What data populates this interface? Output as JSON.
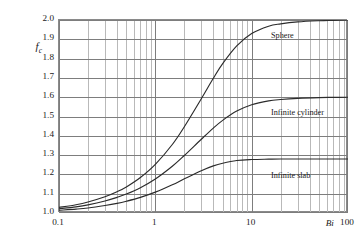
{
  "chart_data": {
    "type": "line",
    "title": "",
    "xlabel": "Bi",
    "ylabel": "f_c",
    "ylabel_base": "f",
    "ylabel_sub": "c",
    "xscale": "log",
    "yscale": "linear",
    "xlim": [
      0.1,
      100
    ],
    "ylim": [
      1.0,
      2.0
    ],
    "grid": true,
    "grid_style": "log-minor-vertical-and-major-horizontal",
    "legend_position": "inline-right",
    "xticks": [
      "0.1",
      "1",
      "10",
      "100"
    ],
    "xtick_values": [
      0.1,
      1,
      10,
      100
    ],
    "yticks": [
      "1.0",
      "1.1",
      "1.2",
      "1.3",
      "1.4",
      "1.5",
      "1.6",
      "1.7",
      "1.8",
      "1.9",
      "2.0"
    ],
    "ytick_values": [
      1.0,
      1.1,
      1.2,
      1.3,
      1.4,
      1.5,
      1.6,
      1.7,
      1.8,
      1.9,
      2.0
    ],
    "x": [
      0.1,
      0.15,
      0.2,
      0.3,
      0.4,
      0.5,
      0.7,
      1.0,
      1.5,
      2.0,
      3.0,
      4.0,
      5.0,
      7.0,
      10.0,
      15.0,
      20.0,
      30.0,
      50.0,
      70.0,
      100.0
    ],
    "series": [
      {
        "name": "Sphere",
        "label": "Sphere",
        "color": "#2b2b2b",
        "plateau": 2.0,
        "values": [
          1.029,
          1.043,
          1.057,
          1.084,
          1.11,
          1.135,
          1.184,
          1.252,
          1.355,
          1.447,
          1.592,
          1.698,
          1.774,
          1.866,
          1.93,
          1.968,
          1.98,
          1.99,
          1.996,
          1.998,
          2.0
        ]
      },
      {
        "name": "Infinite cylinder",
        "label": "Infinite cylinder",
        "color": "#2b2b2b",
        "plateau": 1.6,
        "values": [
          1.022,
          1.032,
          1.042,
          1.062,
          1.081,
          1.098,
          1.131,
          1.176,
          1.242,
          1.298,
          1.382,
          1.44,
          1.48,
          1.528,
          1.561,
          1.581,
          1.588,
          1.594,
          1.598,
          1.599,
          1.6
        ]
      },
      {
        "name": "Infinite slab",
        "label": "Infinite slab",
        "color": "#2b2b2b",
        "plateau": 1.28,
        "values": [
          1.014,
          1.02,
          1.026,
          1.039,
          1.05,
          1.061,
          1.081,
          1.108,
          1.146,
          1.177,
          1.219,
          1.244,
          1.258,
          1.272,
          1.277,
          1.279,
          1.28,
          1.28,
          1.28,
          1.28,
          1.28
        ]
      }
    ],
    "annotations": [
      {
        "text": "Sphere",
        "x_px": 271,
        "y_px": 31
      },
      {
        "text": "Infinite cylinder",
        "x_px": 271,
        "y_px": 108
      },
      {
        "text": "Infinite slab",
        "x_px": 271,
        "y_px": 171
      }
    ],
    "colors": {
      "curve": "#2b2b2b",
      "grid_major": "#7d7d7d",
      "grid_minor": "#b9b9b9",
      "axis": "#8a8a8a",
      "text": "#1a1a1a",
      "background": "#ffffff"
    }
  }
}
